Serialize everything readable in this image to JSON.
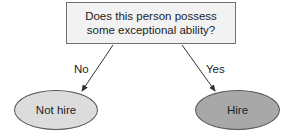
{
  "diagram": {
    "type": "decision-tree",
    "question": "Does this person possess some exceptional ability?",
    "question_lines": [
      "Does this person possess some",
      "exceptional ability?"
    ],
    "branches": [
      {
        "label": "No",
        "outcome": "Not hire",
        "fill": "#dcdcdc"
      },
      {
        "label": "Yes",
        "outcome": "Hire",
        "fill": "#a8a8a8"
      }
    ],
    "colors": {
      "box_fill": "#f2f2f2",
      "border": "#707070",
      "arrow": "#333333"
    }
  }
}
